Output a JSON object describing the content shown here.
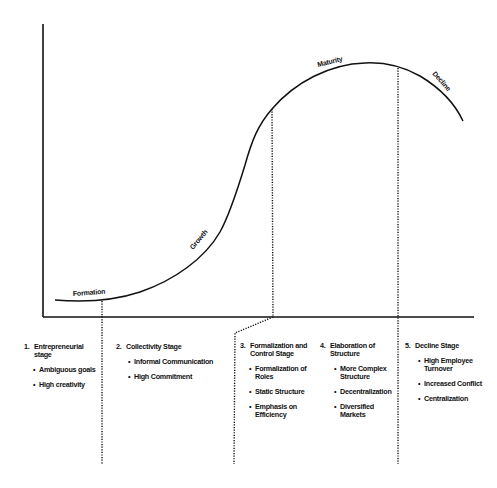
{
  "diagram": {
    "type": "organizational-life-cycle",
    "curve_labels": [
      {
        "id": "formation",
        "text": "Formation"
      },
      {
        "id": "growth",
        "text": "Growth"
      },
      {
        "id": "maturity",
        "text": "Maturity"
      },
      {
        "id": "decline",
        "text": "Decline"
      }
    ],
    "line_color": "#111111",
    "background": "#ffffff"
  },
  "stages": [
    {
      "number": "1.",
      "title": "Entrepreneurial stage",
      "bullets": [
        "Ambiguous goals",
        "High creativity"
      ]
    },
    {
      "number": "2.",
      "title": "Collectivity Stage",
      "bullets": [
        "Informal Communication",
        "High Commitment"
      ]
    },
    {
      "number": "3.",
      "title": "Formalization and Control Stage",
      "bullets": [
        "Formalization of Roles",
        "Static Structure",
        "Emphasis on Efficiency"
      ]
    },
    {
      "number": "4.",
      "title": "Elaboration of Structure",
      "bullets": [
        "More Complex Structure",
        "Decentralization",
        "Diversified Markets"
      ]
    },
    {
      "number": "5.",
      "title": "Decline Stage",
      "bullets": [
        "High Employee Turnover",
        "Increased Conflict",
        "Centralization"
      ]
    }
  ]
}
